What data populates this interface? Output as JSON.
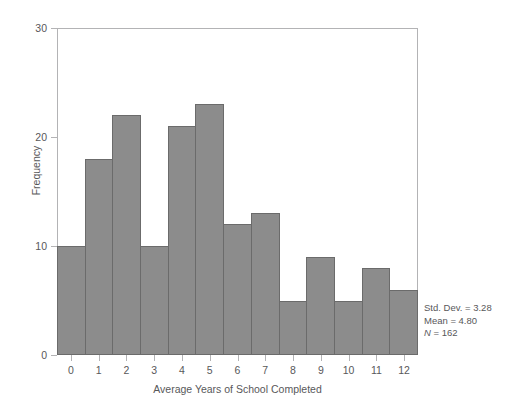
{
  "chart_data": {
    "type": "bar",
    "title": "",
    "subtitle": "",
    "xlabel": "Average Years of School Completed",
    "ylabel": "Frequency",
    "categories": [
      "0",
      "1",
      "2",
      "3",
      "4",
      "5",
      "6",
      "7",
      "8",
      "9",
      "10",
      "11",
      "12"
    ],
    "values": [
      10,
      18,
      22,
      10,
      21,
      23,
      12,
      13,
      5,
      9,
      5,
      8,
      6
    ],
    "xlim": [
      -0.5,
      12.5
    ],
    "ylim": [
      0,
      30
    ],
    "yticks": [
      0,
      10,
      20,
      30
    ],
    "xticks": [
      "0",
      "1",
      "2",
      "3",
      "4",
      "5",
      "6",
      "7",
      "8",
      "9",
      "10",
      "11",
      "12"
    ],
    "grid": false,
    "legend": null,
    "bar_fill_color": "#8c8c8c",
    "bar_edge_color": "#6b6b6b",
    "frame_color": "#b3b3b5",
    "text_color": "#58585a",
    "annotations": [
      "Std. Dev. = 3.28",
      "Mean = 4.80",
      "N = 162"
    ]
  },
  "annotation_box": {
    "std_dev_line": "Std. Dev. = 3.28",
    "mean_line": "Mean = 4.80",
    "n_symbol": "N",
    "n_value": " = 162"
  }
}
